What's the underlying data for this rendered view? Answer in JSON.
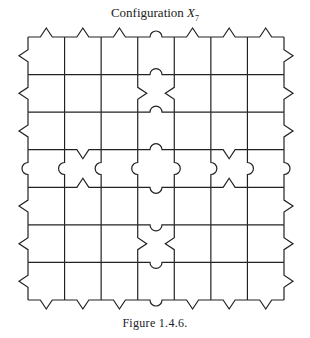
{
  "figure": {
    "title_prefix": "Configuration ",
    "title_var": "X",
    "title_sub": "7",
    "caption": "Figure 1.4.6."
  },
  "grid": {
    "rows": 7,
    "cols": 7,
    "x0": 28,
    "y0": 37,
    "x1": 284,
    "y1": 300,
    "stroke": "#222222"
  },
  "edges": {
    "top_border": [
      "tri",
      "tri",
      "tri",
      "round",
      "tri",
      "tri",
      "tri"
    ],
    "bottom_border": [
      "tri",
      "tri",
      "tri",
      "round",
      "tri",
      "tri",
      "tri"
    ],
    "left_border": [
      "tri",
      "tri",
      "tri",
      "round",
      "tri",
      "tri",
      "tri"
    ],
    "right_border": [
      "tri",
      "tri",
      "tri",
      "round",
      "tri",
      "tri",
      "tri"
    ],
    "center_cell": "four outward round bumps",
    "column_3_horizontal_bumps": "round bumps along center column",
    "row_3_vertical_bumps": "round bumps along center row",
    "notches": "triangular inward notches flanking center column at rows 1 and 5 and center row at columns 1 and 5"
  }
}
